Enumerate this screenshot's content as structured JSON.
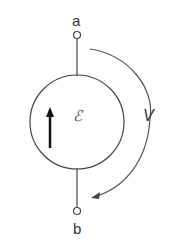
{
  "diagram": {
    "terminals": [
      {
        "label": "a"
      },
      {
        "label": "b"
      }
    ],
    "source_symbol": "ℰ",
    "voltage_label": "V",
    "colors": {
      "stroke": "#444444",
      "text": "#333333"
    }
  }
}
